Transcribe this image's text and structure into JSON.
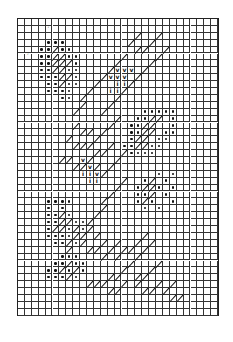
{
  "chart_data": {
    "type": "table",
    "title": "",
    "grid": {
      "columns": 29,
      "rows": 43,
      "cell_px": 6.9,
      "origin_px": [
        17,
        18
      ]
    },
    "legend_symbols": [
      {
        "symbol": "dot",
        "meaning": "filled dot stitch"
      },
      {
        "symbol": "slash",
        "meaning": "diagonal stitch"
      },
      {
        "symbol": "vee",
        "meaning": "v stitch"
      },
      {
        "symbol": "eye",
        "meaning": "i stitch"
      },
      {
        "symbol": "tick",
        "meaning": "small tick mark"
      }
    ],
    "regions": [
      {
        "name": "upper-left dots",
        "symbol": "dot",
        "cells": [
          [
            4,
            3
          ],
          [
            5,
            3
          ],
          [
            6,
            3
          ],
          [
            3,
            4
          ],
          [
            4,
            4
          ],
          [
            6,
            4
          ],
          [
            7,
            4
          ],
          [
            3,
            5
          ],
          [
            4,
            5
          ],
          [
            7,
            5
          ],
          [
            8,
            5
          ],
          [
            3,
            6
          ],
          [
            4,
            6
          ],
          [
            8,
            6
          ],
          [
            3,
            7
          ],
          [
            4,
            7
          ],
          [
            7,
            7
          ],
          [
            8,
            7
          ],
          [
            3,
            8
          ],
          [
            4,
            8
          ],
          [
            5,
            8
          ],
          [
            8,
            8
          ],
          [
            4,
            9
          ],
          [
            5,
            9
          ],
          [
            7,
            9
          ],
          [
            8,
            9
          ],
          [
            4,
            10
          ],
          [
            5,
            10
          ],
          [
            6,
            10
          ],
          [
            7,
            10
          ],
          [
            6,
            11
          ],
          [
            7,
            11
          ]
        ]
      },
      {
        "name": "upper-left slashes",
        "symbol": "slash",
        "cells": [
          [
            5,
            4
          ],
          [
            5,
            5
          ],
          [
            6,
            5
          ],
          [
            5,
            6
          ],
          [
            6,
            6
          ],
          [
            7,
            6
          ],
          [
            5,
            7
          ],
          [
            6,
            7
          ],
          [
            6,
            8
          ],
          [
            7,
            8
          ],
          [
            6,
            9
          ]
        ]
      },
      {
        "name": "upper-right diagonal band",
        "symbol": "slash",
        "cells": [
          [
            17,
            2
          ],
          [
            16,
            3
          ],
          [
            20,
            2
          ],
          [
            19,
            3
          ],
          [
            18,
            4
          ],
          [
            17,
            4
          ],
          [
            21,
            4
          ],
          [
            20,
            5
          ],
          [
            15,
            5
          ],
          [
            14,
            6
          ],
          [
            19,
            6
          ],
          [
            18,
            7
          ],
          [
            13,
            7
          ],
          [
            12,
            8
          ],
          [
            17,
            8
          ],
          [
            16,
            9
          ],
          [
            11,
            9
          ],
          [
            10,
            10
          ],
          [
            15,
            10
          ],
          [
            14,
            11
          ],
          [
            9,
            11
          ],
          [
            9,
            12
          ],
          [
            13,
            12
          ],
          [
            12,
            13
          ],
          [
            8,
            13
          ]
        ]
      },
      {
        "name": "upper-right v marks",
        "symbol": "vee",
        "cells": [
          [
            14,
            7
          ],
          [
            15,
            7
          ],
          [
            16,
            7
          ],
          [
            13,
            8
          ],
          [
            14,
            8
          ],
          [
            15,
            8
          ]
        ]
      },
      {
        "name": "upper-right i marks",
        "symbol": "eye",
        "cells": [
          [
            14,
            9
          ],
          [
            15,
            9
          ],
          [
            13,
            10
          ],
          [
            14,
            10
          ]
        ]
      },
      {
        "name": "right dots",
        "symbol": "dot",
        "cells": [
          [
            18,
            13
          ],
          [
            19,
            13
          ],
          [
            20,
            13
          ],
          [
            21,
            13
          ],
          [
            22,
            13
          ],
          [
            17,
            14
          ],
          [
            18,
            14
          ],
          [
            22,
            14
          ],
          [
            16,
            15
          ],
          [
            17,
            15
          ],
          [
            22,
            15
          ],
          [
            16,
            16
          ],
          [
            17,
            16
          ],
          [
            21,
            16
          ],
          [
            22,
            16
          ],
          [
            16,
            17
          ],
          [
            20,
            17
          ],
          [
            21,
            17
          ],
          [
            15,
            18
          ],
          [
            16,
            18
          ],
          [
            19,
            18
          ],
          [
            20,
            18
          ],
          [
            15,
            19
          ],
          [
            16,
            19
          ],
          [
            17,
            19
          ],
          [
            18,
            19
          ],
          [
            19,
            19
          ],
          [
            20,
            22
          ],
          [
            22,
            22
          ],
          [
            18,
            23
          ],
          [
            21,
            23
          ],
          [
            17,
            24
          ],
          [
            20,
            24
          ],
          [
            22,
            24
          ],
          [
            17,
            25
          ],
          [
            18,
            25
          ],
          [
            21,
            25
          ],
          [
            17,
            26
          ],
          [
            19,
            26
          ],
          [
            22,
            26
          ],
          [
            18,
            27
          ],
          [
            20,
            27
          ]
        ]
      },
      {
        "name": "right slashes",
        "symbol": "slash",
        "cells": [
          [
            19,
            14
          ],
          [
            20,
            14
          ],
          [
            18,
            15
          ],
          [
            19,
            15
          ],
          [
            18,
            16
          ],
          [
            19,
            16
          ],
          [
            17,
            17
          ],
          [
            18,
            17
          ],
          [
            17,
            18
          ],
          [
            18,
            18
          ],
          [
            19,
            23
          ],
          [
            18,
            24
          ],
          [
            19,
            24
          ],
          [
            19,
            25
          ],
          [
            18,
            26
          ]
        ]
      },
      {
        "name": "middle slashes",
        "symbol": "slash",
        "cells": [
          [
            8,
            15
          ],
          [
            9,
            16
          ],
          [
            10,
            16
          ],
          [
            7,
            17
          ],
          [
            8,
            18
          ],
          [
            9,
            18
          ],
          [
            10,
            18
          ],
          [
            11,
            17
          ],
          [
            12,
            16
          ],
          [
            13,
            15
          ],
          [
            14,
            14
          ],
          [
            11,
            19
          ],
          [
            12,
            19
          ],
          [
            13,
            18
          ],
          [
            6,
            20
          ],
          [
            7,
            20
          ],
          [
            8,
            21
          ],
          [
            9,
            21
          ],
          [
            10,
            20
          ],
          [
            11,
            21
          ],
          [
            12,
            22
          ],
          [
            13,
            21
          ],
          [
            14,
            20
          ],
          [
            15,
            19
          ]
        ]
      },
      {
        "name": "middle v marks",
        "symbol": "vee",
        "cells": [
          [
            9,
            20
          ],
          [
            10,
            21
          ],
          [
            11,
            22
          ]
        ]
      },
      {
        "name": "middle i marks",
        "symbol": "eye",
        "cells": [
          [
            9,
            22
          ],
          [
            10,
            22
          ],
          [
            10,
            23
          ],
          [
            11,
            23
          ]
        ]
      },
      {
        "name": "lower-left dots",
        "symbol": "dot",
        "cells": [
          [
            4,
            26
          ],
          [
            5,
            26
          ],
          [
            6,
            26
          ],
          [
            7,
            26
          ],
          [
            4,
            27
          ],
          [
            6,
            27
          ],
          [
            4,
            28
          ],
          [
            5,
            28
          ],
          [
            7,
            28
          ],
          [
            4,
            29
          ],
          [
            5,
            29
          ],
          [
            8,
            29
          ],
          [
            9,
            29
          ],
          [
            4,
            30
          ],
          [
            7,
            30
          ],
          [
            9,
            30
          ],
          [
            4,
            31
          ],
          [
            5,
            31
          ],
          [
            6,
            31
          ],
          [
            7,
            31
          ],
          [
            5,
            32
          ],
          [
            6,
            32
          ],
          [
            8,
            32
          ],
          [
            6,
            34
          ],
          [
            7,
            34
          ],
          [
            8,
            34
          ],
          [
            5,
            35
          ],
          [
            6,
            35
          ],
          [
            8,
            35
          ],
          [
            9,
            35
          ],
          [
            4,
            36
          ],
          [
            5,
            36
          ],
          [
            7,
            36
          ],
          [
            9,
            36
          ],
          [
            4,
            37
          ],
          [
            5,
            37
          ],
          [
            6,
            37
          ],
          [
            8,
            37
          ]
        ]
      },
      {
        "name": "lower-left slashes",
        "symbol": "slash",
        "cells": [
          [
            6,
            28
          ],
          [
            6,
            29
          ],
          [
            7,
            29
          ],
          [
            5,
            30
          ],
          [
            6,
            30
          ],
          [
            8,
            30
          ],
          [
            8,
            31
          ],
          [
            9,
            31
          ],
          [
            7,
            32
          ],
          [
            9,
            32
          ],
          [
            7,
            33
          ],
          [
            10,
            33
          ],
          [
            7,
            35
          ],
          [
            6,
            36
          ],
          [
            8,
            36
          ],
          [
            7,
            37
          ]
        ]
      },
      {
        "name": "lower diagonal band",
        "symbol": "slash",
        "cells": [
          [
            15,
            23
          ],
          [
            14,
            24
          ],
          [
            13,
            25
          ],
          [
            12,
            26
          ],
          [
            12,
            27
          ],
          [
            11,
            28
          ],
          [
            10,
            29
          ],
          [
            10,
            30
          ],
          [
            11,
            31
          ],
          [
            12,
            32
          ],
          [
            11,
            33
          ],
          [
            14,
            32
          ],
          [
            13,
            33
          ],
          [
            12,
            34
          ],
          [
            15,
            33
          ],
          [
            14,
            34
          ],
          [
            16,
            33
          ],
          [
            17,
            32
          ],
          [
            18,
            31
          ],
          [
            19,
            32
          ],
          [
            18,
            33
          ],
          [
            17,
            34
          ],
          [
            16,
            35
          ],
          [
            15,
            36
          ],
          [
            14,
            37
          ],
          [
            13,
            37
          ],
          [
            20,
            35
          ],
          [
            19,
            36
          ],
          [
            18,
            37
          ],
          [
            17,
            37
          ]
        ]
      },
      {
        "name": "bottom slashes",
        "symbol": "slash",
        "cells": [
          [
            10,
            38
          ],
          [
            11,
            38
          ],
          [
            12,
            38
          ],
          [
            13,
            39
          ],
          [
            14,
            39
          ],
          [
            15,
            38
          ],
          [
            17,
            38
          ],
          [
            18,
            39
          ],
          [
            19,
            39
          ],
          [
            20,
            38
          ],
          [
            21,
            39
          ],
          [
            22,
            38
          ],
          [
            22,
            40
          ],
          [
            23,
            40
          ]
        ]
      },
      {
        "name": "stray ticks",
        "symbol": "tick",
        "cells": [
          [
            4,
            1
          ],
          [
            1,
            5
          ]
        ]
      }
    ]
  }
}
